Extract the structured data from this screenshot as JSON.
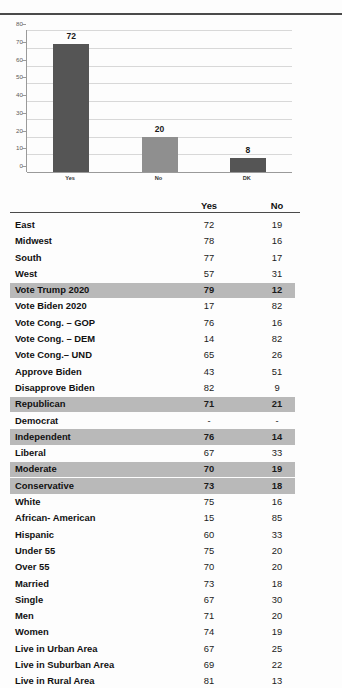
{
  "chart_data": {
    "type": "bar",
    "title": "",
    "xlabel": "",
    "ylabel": "",
    "categories": [
      "Yes",
      "No",
      "DK"
    ],
    "values": [
      72,
      20,
      8
    ],
    "data_labels": [
      "72",
      "20",
      "8"
    ],
    "ylim": [
      0,
      80
    ],
    "yticks": [
      0,
      10,
      20,
      30,
      40,
      50,
      60,
      70,
      80
    ],
    "ytick_labels": [
      "0",
      "10",
      "20",
      "30",
      "40",
      "50",
      "60",
      "70",
      "80"
    ],
    "grid": true,
    "legend": "none",
    "bar_colors": [
      "#555555",
      "#8f8f8f",
      "#555555"
    ]
  },
  "colors": {
    "bar_dark": "#555555",
    "bar_light": "#8f8f8f",
    "row_highlight": "#b9b9b9",
    "rule": "#4a4a4a",
    "gridline": "#d8d8d8"
  },
  "table": {
    "columns": [
      "",
      "Yes",
      "No"
    ],
    "header": {
      "yes": "Yes",
      "no": "No"
    },
    "rows": [
      {
        "label": "East",
        "yes": "72",
        "no": "19",
        "highlight": false
      },
      {
        "label": "Midwest",
        "yes": "78",
        "no": "16",
        "highlight": false
      },
      {
        "label": "South",
        "yes": "77",
        "no": "17",
        "highlight": false
      },
      {
        "label": "West",
        "yes": "57",
        "no": "31",
        "highlight": false
      },
      {
        "label": "Vote Trump 2020",
        "yes": "79",
        "no": "12",
        "highlight": true
      },
      {
        "label": "Vote Biden 2020",
        "yes": "17",
        "no": "82",
        "highlight": false
      },
      {
        "label": "Vote Cong. – GOP",
        "yes": "76",
        "no": "16",
        "highlight": false
      },
      {
        "label": "Vote Cong. – DEM",
        "yes": "14",
        "no": "82",
        "highlight": false
      },
      {
        "label": "Vote Cong.– UND",
        "yes": "65",
        "no": "26",
        "highlight": false
      },
      {
        "label": "Approve Biden",
        "yes": "43",
        "no": "51",
        "highlight": false
      },
      {
        "label": "Disapprove Biden",
        "yes": "82",
        "no": "9",
        "highlight": false
      },
      {
        "label": "Republican",
        "yes": "71",
        "no": "21",
        "highlight": true
      },
      {
        "label": "Democrat",
        "yes": "-",
        "no": "-",
        "highlight": false
      },
      {
        "label": "Independent",
        "yes": "76",
        "no": "14",
        "highlight": true
      },
      {
        "label": "Liberal",
        "yes": "67",
        "no": "33",
        "highlight": false
      },
      {
        "label": "Moderate",
        "yes": "70",
        "no": "19",
        "highlight": true
      },
      {
        "label": "Conservative",
        "yes": "73",
        "no": "18",
        "highlight": true
      },
      {
        "label": "White",
        "yes": "75",
        "no": "16",
        "highlight": false
      },
      {
        "label": "African- American",
        "yes": "15",
        "no": "85",
        "highlight": false
      },
      {
        "label": "Hispanic",
        "yes": "60",
        "no": "33",
        "highlight": false
      },
      {
        "label": "Under 55",
        "yes": "75",
        "no": "20",
        "highlight": false
      },
      {
        "label": "Over 55",
        "yes": "70",
        "no": "20",
        "highlight": false
      },
      {
        "label": "Married",
        "yes": "73",
        "no": "18",
        "highlight": false
      },
      {
        "label": "Single",
        "yes": "67",
        "no": "30",
        "highlight": false
      },
      {
        "label": "Men",
        "yes": "71",
        "no": "20",
        "highlight": false
      },
      {
        "label": "Women",
        "yes": "74",
        "no": "19",
        "highlight": false
      },
      {
        "label": "Live in Urban Area",
        "yes": "67",
        "no": "25",
        "highlight": false
      },
      {
        "label": "Live in Suburban Area",
        "yes": "69",
        "no": "22",
        "highlight": false
      },
      {
        "label": "Live in Rural Area",
        "yes": "81",
        "no": "13",
        "highlight": false
      }
    ]
  }
}
